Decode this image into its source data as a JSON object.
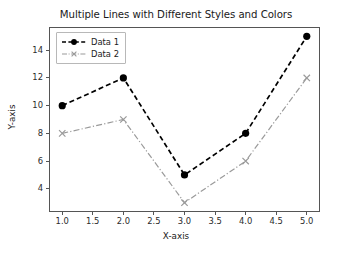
{
  "chart_data": {
    "type": "line",
    "title": "Multiple Lines with Different Styles and Colors",
    "xlabel": "X-axis",
    "ylabel": "Y-axis",
    "x": [
      1.0,
      2.0,
      3.0,
      4.0,
      5.0
    ],
    "series": [
      {
        "name": "Data 1",
        "values": [
          10,
          12,
          5,
          8,
          15
        ],
        "color": "#000000",
        "linestyle": "dashed",
        "marker": "circle"
      },
      {
        "name": "Data 2",
        "values": [
          8,
          9,
          3,
          6,
          12
        ],
        "color": "#9a9a9a",
        "linestyle": "dash-dot",
        "marker": "x"
      }
    ],
    "xlim": [
      0.8,
      5.2
    ],
    "ylim": [
      2.4,
      15.6
    ],
    "xticks": [
      "1.0",
      "1.5",
      "2.0",
      "2.5",
      "3.0",
      "3.5",
      "4.0",
      "4.5",
      "5.0"
    ],
    "xtick_values": [
      1.0,
      1.5,
      2.0,
      2.5,
      3.0,
      3.5,
      4.0,
      4.5,
      5.0
    ],
    "yticks": [
      "4",
      "6",
      "8",
      "10",
      "12",
      "14"
    ],
    "ytick_values": [
      4,
      6,
      8,
      10,
      12,
      14
    ],
    "grid": false,
    "legend_position": "upper left",
    "background": "#ffffff",
    "frame_color": "#555555"
  },
  "legend": {
    "entries": [
      {
        "label": "Data 1"
      },
      {
        "label": "Data 2"
      }
    ]
  }
}
